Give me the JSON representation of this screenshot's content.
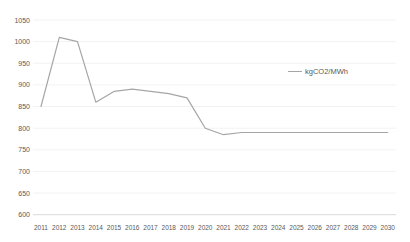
{
  "chart_data": {
    "type": "line",
    "title": "",
    "xlabel": "",
    "ylabel": "",
    "categories": [
      "2011",
      "2012",
      "2013",
      "2014",
      "2015",
      "2016",
      "2017",
      "2018",
      "2019",
      "2020",
      "2021",
      "2022",
      "2023",
      "2024",
      "2025",
      "2026",
      "2027",
      "2028",
      "2029",
      "2030"
    ],
    "series": [
      {
        "name": "kgCO2/MWh",
        "values": [
          850,
          1010,
          1000,
          860,
          885,
          890,
          885,
          880,
          870,
          800,
          785,
          790,
          790,
          790,
          790,
          790,
          790,
          790,
          790,
          790
        ]
      }
    ],
    "ylim": [
      600,
      1050
    ],
    "ytick_step": 50,
    "ytick_labels": [
      "600",
      "650",
      "700",
      "750",
      "800",
      "850",
      "900",
      "950",
      "1000",
      "1050"
    ],
    "grid": "horizontal-faint",
    "legend": {
      "label": "kgCO2/MWh",
      "position": "center-right"
    },
    "colors": {
      "line": "#a6a6a6",
      "axis_text": "#595959",
      "gridline": "#f2f2f2",
      "axis_line": "#d9d9d9",
      "background": "#ffffff"
    }
  }
}
